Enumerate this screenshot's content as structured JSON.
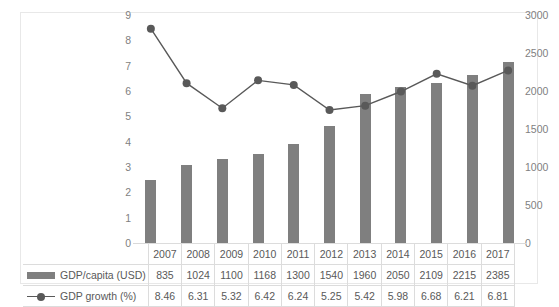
{
  "chart_data": {
    "type": "bar",
    "title": "",
    "subtitle": "",
    "xlabel": "",
    "ylabel": "",
    "grid": false,
    "legend_position": "bottom-table",
    "categories": [
      "2007",
      "2008",
      "2009",
      "2010",
      "2011",
      "2012",
      "2013",
      "2014",
      "2015",
      "2016",
      "2017"
    ],
    "axes": {
      "left": {
        "name": "GDP growth (%)",
        "ylim": [
          0,
          9
        ],
        "ticks": [
          "9",
          "8",
          "7",
          "6",
          "5",
          "4",
          "3",
          "2",
          "1",
          "0"
        ],
        "tick_values": [
          9,
          8,
          7,
          6,
          5,
          4,
          3,
          2,
          1,
          0
        ]
      },
      "right": {
        "name": "GDP/capita (USD)",
        "ylim": [
          0,
          3000
        ],
        "ticks": [
          "3000",
          "2500",
          "2000",
          "1500",
          "1000",
          "500",
          "0"
        ],
        "tick_values": [
          3000,
          2500,
          2000,
          1500,
          1000,
          500,
          0
        ]
      }
    },
    "series": [
      {
        "name": "GDP/capita (USD)",
        "type": "bar",
        "axis": "right",
        "color": "#7f7f7f",
        "values": [
          835,
          1024,
          1100,
          1168,
          1300,
          1540,
          1960,
          2050,
          2109,
          2215,
          2385
        ],
        "labels": [
          "835",
          "1024",
          "1100",
          "1168",
          "1300",
          "1540",
          "1960",
          "2050",
          "2109",
          "2215",
          "2385"
        ]
      },
      {
        "name": "GDP growth (%)",
        "type": "line",
        "axis": "left",
        "color": "#595959",
        "values": [
          8.46,
          6.31,
          5.32,
          6.42,
          6.24,
          5.25,
          5.42,
          5.98,
          6.68,
          6.21,
          6.81
        ],
        "labels": [
          "8.46",
          "6.31",
          "5.32",
          "6.42",
          "6.24",
          "5.25",
          "5.42",
          "5.98",
          "6.68",
          "6.21",
          "6.81"
        ]
      }
    ]
  },
  "table": {
    "year_header": [
      "2007",
      "2008",
      "2009",
      "2010",
      "2011",
      "2012",
      "2013",
      "2014",
      "2015",
      "2016",
      "2017"
    ],
    "rows": [
      {
        "legend_label": "GDP/capita (USD)",
        "legend_icon": "bar-swatch-icon",
        "values": [
          "835",
          "1024",
          "1100",
          "1168",
          "1300",
          "1540",
          "1960",
          "2050",
          "2109",
          "2215",
          "2385"
        ]
      },
      {
        "legend_label": "GDP growth (%)",
        "legend_icon": "line-marker-swatch-icon",
        "values": [
          "8.46",
          "6.31",
          "5.32",
          "6.42",
          "6.24",
          "5.25",
          "5.42",
          "5.98",
          "6.68",
          "6.21",
          "6.81"
        ]
      }
    ]
  },
  "colors": {
    "bar": "#7f7f7f",
    "line": "#595959",
    "marker": "#595959",
    "tick_text": "#7f7f7f",
    "table_text": "#595959",
    "table_border": "#dcdcdc",
    "frame_border": "#e8e8e8",
    "background": "#ffffff"
  }
}
